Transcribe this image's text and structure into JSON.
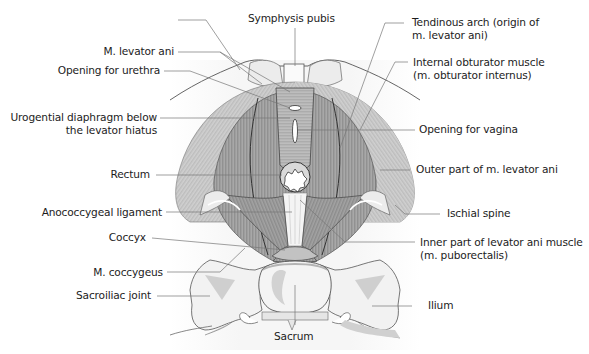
{
  "figure": {
    "colors": {
      "background": "#ffffff",
      "muscle_dark": "#9a9a9a",
      "muscle_light": "#c9c9c9",
      "bone": "#f2f2f2",
      "bone_shade": "#cfcfcf",
      "line": "#444444",
      "leader": "#777777",
      "text": "#1c1c1c"
    }
  },
  "labels": {
    "left": [
      {
        "id": "levator_ani",
        "lines": [
          "M. levator ani"
        ]
      },
      {
        "id": "urethra",
        "lines": [
          "Opening for urethra"
        ]
      },
      {
        "id": "urogenital",
        "lines": [
          "Urogential diaphragm below",
          "the levator hiatus"
        ]
      },
      {
        "id": "rectum",
        "lines": [
          "Rectum"
        ]
      },
      {
        "id": "anococcygeal",
        "lines": [
          "Anococcygeal ligament"
        ]
      },
      {
        "id": "coccyx",
        "lines": [
          "Coccyx"
        ]
      },
      {
        "id": "coccygeus",
        "lines": [
          "M. coccygeus"
        ]
      },
      {
        "id": "sacroiliac",
        "lines": [
          "Sacroiliac joint"
        ]
      }
    ],
    "top": [
      {
        "id": "symphysis",
        "lines": [
          "Symphysis pubis"
        ]
      }
    ],
    "right": [
      {
        "id": "tendinous_arch",
        "lines": [
          "Tendinous arch (origin of",
          "m. levator ani)"
        ]
      },
      {
        "id": "obturator",
        "lines": [
          "Internal obturator muscle",
          "(m. obturator internus)"
        ]
      },
      {
        "id": "vagina",
        "lines": [
          "Opening for vagina"
        ]
      },
      {
        "id": "outer_levator",
        "lines": [
          "Outer part of m. levator ani"
        ]
      },
      {
        "id": "ischial_spine",
        "lines": [
          "Ischial spine"
        ]
      },
      {
        "id": "inner_levator",
        "lines": [
          "Inner part of levator ani muscle",
          "(m. puborectalis)"
        ]
      },
      {
        "id": "ilium",
        "lines": [
          "Ilium"
        ]
      }
    ],
    "bottom": [
      {
        "id": "sacrum",
        "lines": [
          "Sacrum"
        ]
      }
    ]
  }
}
